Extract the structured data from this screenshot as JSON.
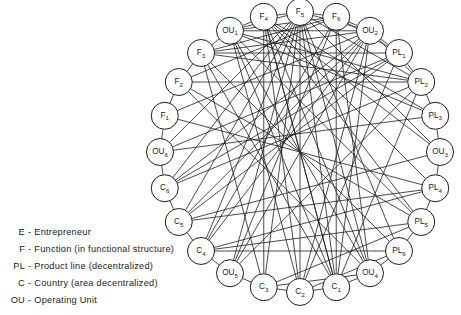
{
  "figure": {
    "geometry": {
      "center_x": 300,
      "center_y": 152,
      "node_ring_radius": 140,
      "node_radius": 13.5,
      "node_count": 24,
      "start_angle_deg": -90
    },
    "style": {
      "line_color": "#1d1d1d",
      "node_fill": "#ffffff",
      "node_stroke": "#1d1d1d",
      "background": "#ffffff",
      "line_width": 0.8,
      "node_stroke_width": 1.0
    },
    "nodes": [
      {
        "id": "F5",
        "prefix": "F",
        "sub": "5",
        "index": 0
      },
      {
        "id": "F6",
        "prefix": "F",
        "sub": "6",
        "index": 1
      },
      {
        "id": "OU2",
        "prefix": "OU",
        "sub": "2",
        "index": 2
      },
      {
        "id": "PL1",
        "prefix": "PL",
        "sub": "1",
        "index": 3
      },
      {
        "id": "PL2",
        "prefix": "PL",
        "sub": "2",
        "index": 4
      },
      {
        "id": "PL3",
        "prefix": "PL",
        "sub": "3",
        "index": 5
      },
      {
        "id": "OU3",
        "prefix": "OU",
        "sub": "3",
        "index": 6
      },
      {
        "id": "PL4",
        "prefix": "PL",
        "sub": "4",
        "index": 7
      },
      {
        "id": "PL5",
        "prefix": "PL",
        "sub": "5",
        "index": 8
      },
      {
        "id": "PL6",
        "prefix": "PL",
        "sub": "6",
        "index": 9
      },
      {
        "id": "OU4",
        "prefix": "OU",
        "sub": "4",
        "index": 10
      },
      {
        "id": "C1",
        "prefix": "C",
        "sub": "1",
        "index": 11
      },
      {
        "id": "C2",
        "prefix": "C",
        "sub": "2",
        "index": 12
      },
      {
        "id": "C3",
        "prefix": "C",
        "sub": "3",
        "index": 13
      },
      {
        "id": "OU5",
        "prefix": "OU",
        "sub": "5",
        "index": 14
      },
      {
        "id": "C4",
        "prefix": "C",
        "sub": "4",
        "index": 15
      },
      {
        "id": "C5",
        "prefix": "C",
        "sub": "5",
        "index": 16
      },
      {
        "id": "C6",
        "prefix": "C",
        "sub": "6",
        "index": 17
      },
      {
        "id": "OU6",
        "prefix": "OU",
        "sub": "6",
        "index": 18
      },
      {
        "id": "F1",
        "prefix": "F",
        "sub": "1",
        "index": 19
      },
      {
        "id": "F2",
        "prefix": "F",
        "sub": "2",
        "index": 20
      },
      {
        "id": "F3",
        "prefix": "F",
        "sub": "3",
        "index": 21
      },
      {
        "id": "OU1",
        "prefix": "OU",
        "sub": "1",
        "index": 22
      },
      {
        "id": "F4",
        "prefix": "F",
        "sub": "4",
        "index": 23
      }
    ],
    "edges": [
      [
        "F5",
        "F6"
      ],
      [
        "F5",
        "OU2"
      ],
      [
        "F5",
        "PL2"
      ],
      [
        "F5",
        "OU4"
      ],
      [
        "F5",
        "C1"
      ],
      [
        "F5",
        "C2"
      ],
      [
        "F5",
        "C3"
      ],
      [
        "F5",
        "OU1"
      ],
      [
        "F6",
        "OU2"
      ],
      [
        "F6",
        "PL1"
      ],
      [
        "F6",
        "OU5"
      ],
      [
        "F6",
        "C4"
      ],
      [
        "F6",
        "C1"
      ],
      [
        "F6",
        "OU1"
      ],
      [
        "F6",
        "F3"
      ],
      [
        "F6",
        "F2"
      ],
      [
        "OU2",
        "PL1"
      ],
      [
        "OU2",
        "PL2"
      ],
      [
        "OU2",
        "F3"
      ],
      [
        "OU2",
        "OU1"
      ],
      [
        "OU2",
        "C6"
      ],
      [
        "OU2",
        "C5"
      ],
      [
        "PL1",
        "PL2"
      ],
      [
        "PL1",
        "OU6"
      ],
      [
        "PL1",
        "C6"
      ],
      [
        "PL1",
        "F3"
      ],
      [
        "PL2",
        "PL3"
      ],
      [
        "PL2",
        "F2"
      ],
      [
        "PL2",
        "F3"
      ],
      [
        "PL2",
        "OU1"
      ],
      [
        "PL3",
        "OU3"
      ],
      [
        "PL3",
        "F4"
      ],
      [
        "PL3",
        "OU1"
      ],
      [
        "OU3",
        "PL4"
      ],
      [
        "OU3",
        "F4"
      ],
      [
        "OU3",
        "F5"
      ],
      [
        "OU3",
        "C5"
      ],
      [
        "PL4",
        "PL5"
      ],
      [
        "PL4",
        "C5"
      ],
      [
        "PL4",
        "C4"
      ],
      [
        "PL4",
        "F4"
      ],
      [
        "PL5",
        "PL6"
      ],
      [
        "PL5",
        "C4"
      ],
      [
        "PL5",
        "C3"
      ],
      [
        "PL5",
        "F4"
      ],
      [
        "PL6",
        "OU4"
      ],
      [
        "PL6",
        "C4"
      ],
      [
        "PL6",
        "C2"
      ],
      [
        "PL6",
        "F5"
      ],
      [
        "OU4",
        "C1"
      ],
      [
        "OU4",
        "C3"
      ],
      [
        "OU4",
        "F6"
      ],
      [
        "OU4",
        "OU1"
      ],
      [
        "C1",
        "C2"
      ],
      [
        "C1",
        "OU1"
      ],
      [
        "C1",
        "F3"
      ],
      [
        "C1",
        "F4"
      ],
      [
        "C1",
        "PL2"
      ],
      [
        "C1",
        "OU2"
      ],
      [
        "C2",
        "C3"
      ],
      [
        "C2",
        "F4"
      ],
      [
        "C2",
        "OU2"
      ],
      [
        "C2",
        "PL1"
      ],
      [
        "C3",
        "OU5"
      ],
      [
        "C3",
        "F4"
      ],
      [
        "C3",
        "F3"
      ],
      [
        "OU5",
        "C4"
      ],
      [
        "OU5",
        "F5"
      ],
      [
        "OU5",
        "PL2"
      ],
      [
        "OU5",
        "OU2"
      ],
      [
        "C4",
        "C5"
      ],
      [
        "C4",
        "F5"
      ],
      [
        "C4",
        "OU2"
      ],
      [
        "C5",
        "C6"
      ],
      [
        "C5",
        "F5"
      ],
      [
        "C5",
        "PL1"
      ],
      [
        "C6",
        "OU6"
      ],
      [
        "C6",
        "F5"
      ],
      [
        "C6",
        "PL2"
      ],
      [
        "OU6",
        "F1"
      ],
      [
        "OU6",
        "PL3"
      ],
      [
        "OU6",
        "F5"
      ],
      [
        "F1",
        "F2"
      ],
      [
        "F1",
        "OU2"
      ],
      [
        "F1",
        "PL4"
      ],
      [
        "F2",
        "F3"
      ],
      [
        "F2",
        "PL5"
      ],
      [
        "F2",
        "OU4"
      ],
      [
        "F3",
        "OU1"
      ],
      [
        "F3",
        "PL6"
      ],
      [
        "OU1",
        "F4"
      ],
      [
        "OU1",
        "PL5"
      ],
      [
        "OU1",
        "C2"
      ],
      [
        "F4",
        "F5"
      ],
      [
        "F4",
        "OU4"
      ],
      [
        "F4",
        "C1"
      ]
    ]
  },
  "legend": {
    "name": "key",
    "items": [
      {
        "abbr": "E",
        "dash": "-",
        "text": "Entrepreneur"
      },
      {
        "abbr": "F",
        "dash": "-",
        "text": "Function (in functional structure)"
      },
      {
        "abbr": "PL",
        "dash": "-",
        "text": "Product line (decentralized)"
      },
      {
        "abbr": "C",
        "dash": "-",
        "text": "Country (area decentralized)"
      },
      {
        "abbr": "OU",
        "dash": "-",
        "text": "Operating Unit"
      }
    ]
  }
}
